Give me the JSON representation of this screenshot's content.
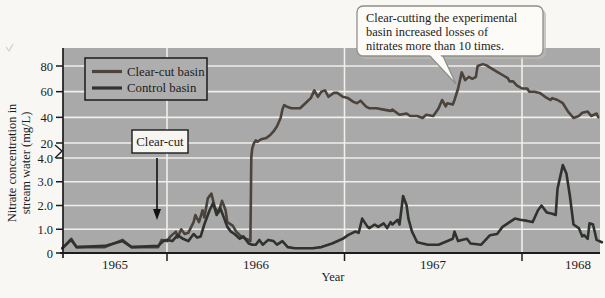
{
  "chart_data": {
    "type": "line",
    "title": "",
    "xlabel": "Year",
    "ylabel": "Nitrate concentration in stream water (mg/L)",
    "ylabel_lines": [
      "Nitrate concentration in",
      "stream water (mg/L)"
    ],
    "x_tick_labels": [
      "1965",
      "1966",
      "1967",
      "1968"
    ],
    "x_range": [
      1965.41,
      1968.45
    ],
    "y_axis": {
      "broken_axis": true,
      "lower_scale_ticks": [
        0,
        1.0,
        2.0,
        3.0,
        4.0
      ],
      "lower_scale_tick_labels": [
        "0",
        "1.0",
        "2.0",
        "3.0",
        "4.0"
      ],
      "upper_scale_ticks": [
        20,
        40,
        60,
        80
      ],
      "upper_scale_tick_labels": [
        "20",
        "40",
        "60",
        "80"
      ],
      "lower_range": [
        0,
        4
      ],
      "upper_range": [
        20,
        80
      ],
      "unit": "mg/L"
    },
    "grid": "on",
    "legend_position": "top-left",
    "series": [
      {
        "name": "Clear-cut basin",
        "color": "#4b433c",
        "points": [
          [
            1965.41,
            0.2
          ],
          [
            1965.46,
            0.6
          ],
          [
            1965.49,
            0.25
          ],
          [
            1965.65,
            0.25
          ],
          [
            1965.75,
            0.55
          ],
          [
            1965.8,
            0.25
          ],
          [
            1965.95,
            0.25
          ],
          [
            1965.97,
            0.55
          ],
          [
            1966.0,
            0.5
          ],
          [
            1966.02,
            0.7
          ],
          [
            1966.05,
            0.9
          ],
          [
            1966.06,
            0.65
          ],
          [
            1966.08,
            1.0
          ],
          [
            1966.1,
            0.8
          ],
          [
            1966.12,
            0.85
          ],
          [
            1966.15,
            1.3
          ],
          [
            1966.16,
            1.6
          ],
          [
            1966.18,
            1.3
          ],
          [
            1966.2,
            1.8
          ],
          [
            1966.21,
            1.5
          ],
          [
            1966.23,
            2.3
          ],
          [
            1966.25,
            2.5
          ],
          [
            1966.27,
            1.9
          ],
          [
            1966.29,
            1.7
          ],
          [
            1966.31,
            2.2
          ],
          [
            1966.33,
            1.8
          ],
          [
            1966.34,
            1.3
          ],
          [
            1966.37,
            1.15
          ],
          [
            1966.39,
            0.9
          ],
          [
            1966.41,
            0.75
          ],
          [
            1966.43,
            0.65
          ],
          [
            1966.46,
            0.55
          ],
          [
            1966.47,
            0.5
          ],
          [
            1966.475,
            5
          ],
          [
            1966.48,
            14
          ],
          [
            1966.49,
            20
          ],
          [
            1966.5,
            22
          ],
          [
            1966.51,
            21
          ],
          [
            1966.53,
            23
          ],
          [
            1966.56,
            24
          ],
          [
            1966.58,
            26
          ],
          [
            1966.6,
            29
          ],
          [
            1966.62,
            33
          ],
          [
            1966.64,
            39.5
          ],
          [
            1966.65,
            46
          ],
          [
            1966.66,
            49.5
          ],
          [
            1966.68,
            48
          ],
          [
            1966.7,
            47
          ],
          [
            1966.75,
            47
          ],
          [
            1966.78,
            51
          ],
          [
            1966.81,
            55
          ],
          [
            1966.83,
            61
          ],
          [
            1966.85,
            56
          ],
          [
            1966.87,
            60
          ],
          [
            1966.89,
            61
          ],
          [
            1966.91,
            56
          ],
          [
            1966.94,
            59
          ],
          [
            1966.96,
            59
          ],
          [
            1966.99,
            56
          ],
          [
            1967.02,
            55
          ],
          [
            1967.05,
            52
          ],
          [
            1967.07,
            51
          ],
          [
            1967.09,
            53
          ],
          [
            1967.12,
            48.5
          ],
          [
            1967.14,
            47
          ],
          [
            1967.18,
            47
          ],
          [
            1967.22,
            46
          ],
          [
            1967.26,
            45
          ],
          [
            1967.27,
            46
          ],
          [
            1967.31,
            42
          ],
          [
            1967.35,
            43
          ],
          [
            1967.37,
            41
          ],
          [
            1967.41,
            41
          ],
          [
            1967.44,
            39.5
          ],
          [
            1967.46,
            42
          ],
          [
            1967.5,
            41
          ],
          [
            1967.53,
            47
          ],
          [
            1967.55,
            53.5
          ],
          [
            1967.57,
            48.5
          ],
          [
            1967.58,
            51
          ],
          [
            1967.61,
            50
          ],
          [
            1967.62,
            53.5
          ],
          [
            1967.64,
            62.5
          ],
          [
            1967.66,
            75
          ],
          [
            1967.68,
            69
          ],
          [
            1967.7,
            71.5
          ],
          [
            1967.72,
            70
          ],
          [
            1967.74,
            71.5
          ],
          [
            1967.75,
            80
          ],
          [
            1967.78,
            81.5
          ],
          [
            1967.8,
            80.5
          ],
          [
            1967.83,
            78
          ],
          [
            1967.86,
            75.5
          ],
          [
            1967.89,
            73
          ],
          [
            1967.92,
            70.5
          ],
          [
            1967.93,
            68
          ],
          [
            1967.95,
            68
          ],
          [
            1967.97,
            65
          ],
          [
            1968.0,
            62.5
          ],
          [
            1968.03,
            62.5
          ],
          [
            1968.04,
            60
          ],
          [
            1968.07,
            60
          ],
          [
            1968.1,
            59
          ],
          [
            1968.13,
            56
          ],
          [
            1968.16,
            53.5
          ],
          [
            1968.17,
            55
          ],
          [
            1968.2,
            53.5
          ],
          [
            1968.23,
            51
          ],
          [
            1968.26,
            44.5
          ],
          [
            1968.29,
            39.5
          ],
          [
            1968.32,
            41
          ],
          [
            1968.34,
            43.5
          ],
          [
            1968.37,
            44.5
          ],
          [
            1968.39,
            41
          ],
          [
            1968.42,
            43
          ],
          [
            1968.43,
            40
          ]
        ]
      },
      {
        "name": "Control basin",
        "color": "#2f332e",
        "points": [
          [
            1965.41,
            0.2
          ],
          [
            1965.46,
            0.55
          ],
          [
            1965.49,
            0.25
          ],
          [
            1965.65,
            0.3
          ],
          [
            1965.75,
            0.5
          ],
          [
            1965.8,
            0.25
          ],
          [
            1965.95,
            0.3
          ],
          [
            1965.98,
            0.5
          ],
          [
            1966.0,
            0.55
          ],
          [
            1966.03,
            0.5
          ],
          [
            1966.06,
            0.75
          ],
          [
            1966.09,
            0.6
          ],
          [
            1966.12,
            0.5
          ],
          [
            1966.15,
            0.8
          ],
          [
            1966.17,
            0.65
          ],
          [
            1966.19,
            0.7
          ],
          [
            1966.21,
            1.2
          ],
          [
            1966.24,
            1.8
          ],
          [
            1966.26,
            2.1
          ],
          [
            1966.28,
            1.6
          ],
          [
            1966.3,
            1.9
          ],
          [
            1966.32,
            1.5
          ],
          [
            1966.34,
            1.1
          ],
          [
            1966.36,
            0.9
          ],
          [
            1966.38,
            0.8
          ],
          [
            1966.41,
            0.6
          ],
          [
            1966.43,
            0.7
          ],
          [
            1966.46,
            0.4
          ],
          [
            1966.48,
            0.35
          ],
          [
            1966.5,
            0.35
          ],
          [
            1966.52,
            0.55
          ],
          [
            1966.54,
            0.35
          ],
          [
            1966.57,
            0.55
          ],
          [
            1966.6,
            0.5
          ],
          [
            1966.62,
            0.35
          ],
          [
            1966.65,
            0.5
          ],
          [
            1966.68,
            0.25
          ],
          [
            1966.72,
            0.2
          ],
          [
            1966.82,
            0.2
          ],
          [
            1966.87,
            0.25
          ],
          [
            1966.93,
            0.4
          ],
          [
            1966.99,
            0.6
          ],
          [
            1967.02,
            0.75
          ],
          [
            1967.06,
            0.9
          ],
          [
            1967.08,
            0.85
          ],
          [
            1967.1,
            1.45
          ],
          [
            1967.13,
            1.1
          ],
          [
            1967.14,
            1.05
          ],
          [
            1967.17,
            1.2
          ],
          [
            1967.19,
            1.1
          ],
          [
            1967.22,
            1.25
          ],
          [
            1967.24,
            1.05
          ],
          [
            1967.26,
            1.3
          ],
          [
            1967.27,
            1.2
          ],
          [
            1967.3,
            1.4
          ],
          [
            1967.31,
            1.2
          ],
          [
            1967.33,
            2.4
          ],
          [
            1967.35,
            2.0
          ],
          [
            1967.36,
            1.45
          ],
          [
            1967.38,
            0.9
          ],
          [
            1967.4,
            0.6
          ],
          [
            1967.41,
            0.45
          ],
          [
            1967.44,
            0.4
          ],
          [
            1967.47,
            0.35
          ],
          [
            1967.53,
            0.35
          ],
          [
            1967.61,
            0.6
          ],
          [
            1967.62,
            0.9
          ],
          [
            1967.64,
            0.5
          ],
          [
            1967.66,
            0.55
          ],
          [
            1967.69,
            0.6
          ],
          [
            1967.71,
            0.4
          ],
          [
            1967.77,
            0.35
          ],
          [
            1967.82,
            0.75
          ],
          [
            1967.86,
            0.8
          ],
          [
            1967.89,
            1.1
          ],
          [
            1967.93,
            1.3
          ],
          [
            1967.96,
            1.45
          ],
          [
            1967.99,
            1.4
          ],
          [
            1968.03,
            1.35
          ],
          [
            1968.06,
            1.3
          ],
          [
            1968.09,
            1.8
          ],
          [
            1968.11,
            2.0
          ],
          [
            1968.14,
            1.7
          ],
          [
            1968.17,
            1.65
          ],
          [
            1968.19,
            1.6
          ],
          [
            1968.2,
            2.7
          ],
          [
            1968.23,
            3.7
          ],
          [
            1968.25,
            3.35
          ],
          [
            1968.27,
            2.4
          ],
          [
            1968.29,
            1.2
          ],
          [
            1968.32,
            1.05
          ],
          [
            1968.34,
            0.7
          ],
          [
            1968.35,
            0.75
          ],
          [
            1968.37,
            0.6
          ],
          [
            1968.38,
            1.25
          ],
          [
            1968.4,
            1.2
          ],
          [
            1968.42,
            0.55
          ],
          [
            1968.45,
            0.45
          ]
        ]
      }
    ],
    "annotations": {
      "clear_cut_box_label": "Clear-cut",
      "clear_cut_event_year": 1965.95,
      "callout_line1": "Clear-cutting the experimental",
      "callout_line2": "basin increased losses of",
      "callout_line3": "nitrates more than 10 times.",
      "callout_points_to": [
        1967.64,
        62.5
      ]
    }
  },
  "legend": {
    "entry1": "Clear-cut basin",
    "entry2": "Control basin"
  },
  "axis_titles": {
    "x": "Year",
    "y_line1": "Nitrate concentration in",
    "y_line2": "stream water (mg/L)"
  },
  "colors": {
    "plot_background": "#a9a9a9",
    "gridline": "#f0efeb",
    "clear_cut_line": "#4b433c",
    "control_line": "#2f332e",
    "page_background": "#f8f7f3"
  }
}
